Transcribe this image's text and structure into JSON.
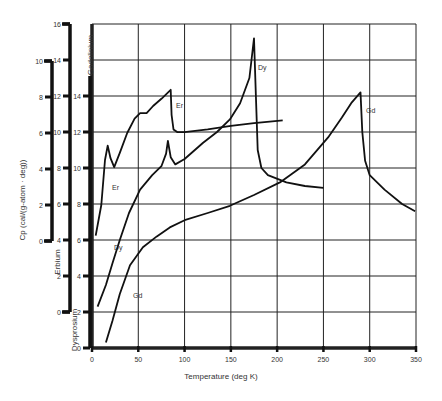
{
  "chart_data": {
    "type": "line",
    "title": "",
    "xlabel": "Temperature (deg K)",
    "ylabel": "Cp (cal/(g-atom · deg))",
    "xlim": [
      0,
      350
    ],
    "x_ticks": [
      0,
      50,
      100,
      150,
      200,
      250,
      300,
      350
    ],
    "grid": true,
    "legend": "none (curves labeled inline: Er, Dy, Gd)",
    "y_axes": [
      {
        "name": "Erbium",
        "ticks": [
          0,
          2,
          4,
          6,
          8,
          10
        ],
        "applies_to": "Er"
      },
      {
        "name": "Dysprosium",
        "ticks": [
          0,
          2,
          4,
          6,
          8,
          10,
          12,
          14,
          16
        ],
        "applies_to": "Dy"
      },
      {
        "name": "Gadolinium",
        "ticks": [
          0,
          2,
          4,
          6,
          8,
          10,
          12,
          14
        ],
        "applies_to": "Gd"
      }
    ],
    "series": [
      {
        "name": "Er",
        "axis": "Erbium",
        "x": [
          4,
          10,
          14,
          17,
          20,
          24,
          30,
          38,
          46,
          52,
          59,
          66,
          75,
          85,
          86,
          88,
          92,
          100,
          125,
          150,
          175,
          206
        ],
        "y": [
          0.3,
          2.0,
          4.5,
          5.3,
          4.6,
          4.1,
          4.9,
          6.0,
          6.8,
          7.1,
          7.1,
          7.5,
          7.9,
          8.4,
          7.0,
          6.2,
          6.05,
          6.05,
          6.2,
          6.4,
          6.55,
          6.7
        ]
      },
      {
        "name": "Dy",
        "axis": "Dysprosium",
        "x": [
          6,
          15,
          22,
          30,
          40,
          52,
          65,
          75,
          80,
          82,
          85,
          90,
          100,
          120,
          135,
          149,
          160,
          170,
          175,
          177,
          179,
          183,
          190,
          210,
          230,
          250
        ],
        "y": [
          0.3,
          1.5,
          2.7,
          4.0,
          5.5,
          6.8,
          7.6,
          8.1,
          8.8,
          9.5,
          8.6,
          8.2,
          8.5,
          9.4,
          10.0,
          10.7,
          11.6,
          13.0,
          15.2,
          12.0,
          9.0,
          8.0,
          7.6,
          7.2,
          7.0,
          6.9
        ]
      },
      {
        "name": "Gd",
        "axis": "Gadolinium",
        "x": [
          15,
          22,
          30,
          41,
          55,
          70,
          84,
          100,
          125,
          149,
          175,
          203,
          230,
          255,
          270,
          280,
          290,
          292,
          295,
          300,
          316,
          335,
          349
        ],
        "y": [
          0.3,
          1.5,
          3.0,
          4.6,
          5.6,
          6.2,
          6.7,
          7.1,
          7.5,
          7.9,
          8.5,
          9.2,
          10.2,
          11.7,
          12.8,
          13.6,
          14.2,
          12.0,
          10.4,
          9.6,
          8.8,
          8.0,
          7.6
        ]
      }
    ],
    "annotations": [
      "Er",
      "Er",
      "Dy",
      "Dy",
      "Gd",
      "Gd"
    ]
  },
  "labels": {
    "xlabel": "Temperature (deg K)",
    "ylabel": "Cp (cal/(g-atom · deg))",
    "axis_erbium": "Erbium",
    "axis_dysprosium": "Dysprosium",
    "axis_gadolinium": "Gadolinium",
    "er": "Er",
    "dy": "Dy",
    "gd": "Gd"
  }
}
